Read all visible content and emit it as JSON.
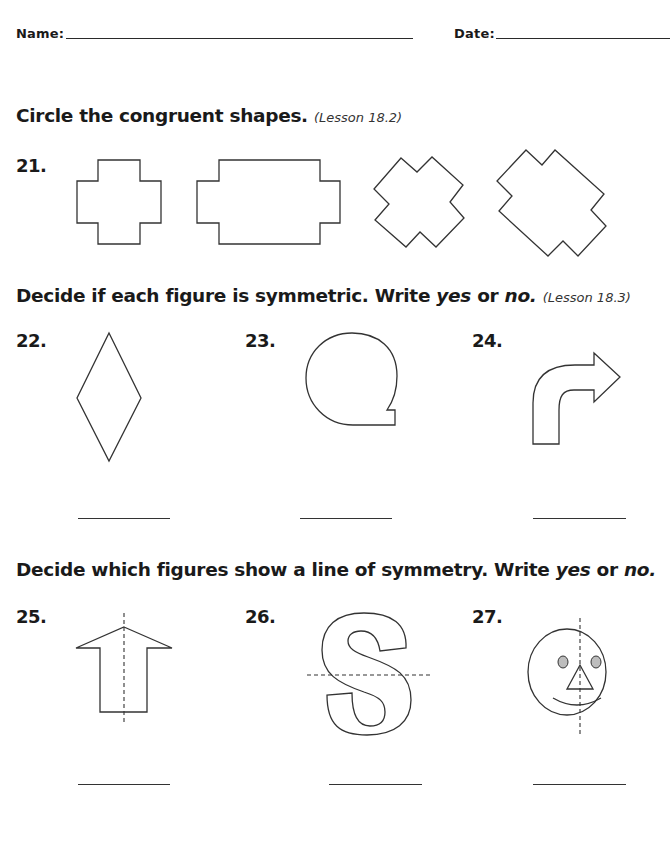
{
  "header": {
    "name_label": "Name:",
    "date_label": "Date:"
  },
  "sections": [
    {
      "instruction_main": "Circle the congruent shapes.",
      "lesson": "(Lesson 18.2)",
      "questions": [
        {
          "number": "21.",
          "figures": [
            "small-cross",
            "wide-cross",
            "rotated-small-cross",
            "rotated-large-cross"
          ]
        }
      ]
    },
    {
      "instruction_pre": "Decide if each figure is symmetric. Write ",
      "yes": "yes",
      "or": " or ",
      "no": "no.",
      "lesson": "(Lesson 18.3)",
      "questions": [
        {
          "number": "22.",
          "figure": "rhombus",
          "answer": ""
        },
        {
          "number": "23.",
          "figure": "q-shape",
          "answer": ""
        },
        {
          "number": "24.",
          "figure": "bent-arrow",
          "answer": ""
        }
      ]
    },
    {
      "instruction_pre": "Decide which figures show a line of symmetry. Write ",
      "yes": "yes",
      "or": " or ",
      "no": "no.",
      "questions": [
        {
          "number": "25.",
          "figure": "up-arrow-with-vertical-line",
          "answer": ""
        },
        {
          "number": "26.",
          "figure": "letter-s-with-horizontal-line",
          "answer": ""
        },
        {
          "number": "27.",
          "figure": "face-with-vertical-line",
          "answer": ""
        }
      ]
    }
  ]
}
